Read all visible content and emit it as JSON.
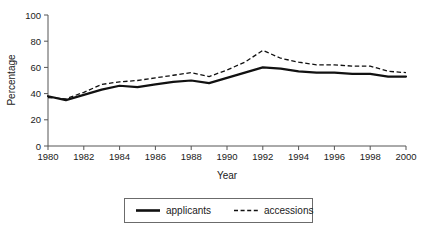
{
  "chart_data": {
    "type": "line",
    "title": "",
    "xlabel": "Year",
    "ylabel": "Percentage",
    "xlim": [
      1980,
      2000
    ],
    "ylim": [
      0,
      100
    ],
    "xticks": [
      1980,
      1982,
      1984,
      1986,
      1988,
      1990,
      1992,
      1994,
      1996,
      1998,
      2000
    ],
    "xtick_labels": [
      "1980",
      "1982",
      "1984",
      "1986",
      "1988",
      "1990",
      "1992",
      "1994",
      "1996",
      "1998",
      "2000"
    ],
    "yticks": [
      0,
      20,
      40,
      60,
      80,
      100
    ],
    "ytick_labels": [
      "0",
      "20",
      "40",
      "60",
      "80",
      "100"
    ],
    "grid": false,
    "legend_position": "bottom-center",
    "x": [
      1980,
      1981,
      1982,
      1983,
      1984,
      1985,
      1986,
      1987,
      1988,
      1989,
      1990,
      1991,
      1992,
      1993,
      1994,
      1995,
      1996,
      1997,
      1998,
      1999,
      2000
    ],
    "series": [
      {
        "name": "applicants",
        "style": "solid",
        "color": "#111111",
        "values": [
          38,
          35,
          39,
          43,
          46,
          45,
          47,
          49,
          50,
          48,
          52,
          56,
          60,
          59,
          57,
          56,
          56,
          55,
          55,
          53,
          53
        ]
      },
      {
        "name": "accessions",
        "style": "dashed",
        "color": "#111111",
        "values": [
          37,
          36,
          41,
          47,
          49,
          50,
          52,
          54,
          56,
          53,
          58,
          64,
          73,
          67,
          64,
          62,
          62,
          61,
          61,
          57,
          56
        ]
      }
    ]
  },
  "legend": {
    "items": [
      {
        "label": "applicants",
        "style": "solid"
      },
      {
        "label": "accessions",
        "style": "dashed"
      }
    ]
  }
}
